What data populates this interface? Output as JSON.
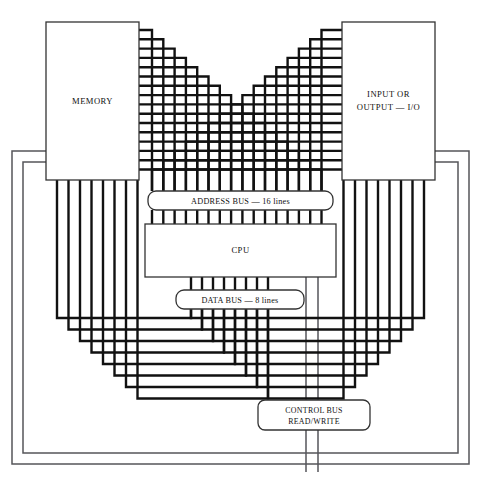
{
  "diagram": {
    "background": "#ffffff",
    "line_color": "#111111",
    "thin_line_color": "#55555a",
    "box_stroke": "#333333",
    "blocks": {
      "memory": {
        "label": "MEMORY",
        "x": 46,
        "y": 22,
        "w": 93,
        "h": 158
      },
      "io": {
        "label_line1": "INPUT OR",
        "label_line2": "OUTPUT — I/O",
        "x": 342,
        "y": 22,
        "w": 93,
        "h": 158
      },
      "cpu": {
        "label": "CPU",
        "x": 145,
        "y": 224,
        "w": 191,
        "h": 53
      },
      "address_bus": {
        "label": "ADDRESS BUS — 16 lines",
        "x": 148,
        "y": 191,
        "w": 185,
        "h": 19,
        "lines": 16
      },
      "data_bus": {
        "label": "DATA BUS — 8 lines",
        "x": 176,
        "y": 290,
        "w": 128,
        "h": 19,
        "lines": 8
      },
      "control_bus": {
        "label_line1": "CONTROL BUS",
        "label_line2": "READ/WRITE",
        "x": 258,
        "y": 400,
        "w": 112,
        "h": 30,
        "lines": 2
      }
    },
    "buses": [
      {
        "name": "address-bus",
        "width_lines": 16,
        "label": "ADDRESS BUS — 16 lines",
        "routing": "staircase-top"
      },
      {
        "name": "data-bus",
        "width_lines": 8,
        "label": "DATA BUS — 8 lines",
        "routing": "nested-u-bottom"
      },
      {
        "name": "control-bus",
        "width_lines": 2,
        "label": "CONTROL BUS READ/WRITE",
        "routing": "outer-perimeter"
      }
    ],
    "geometry": {
      "addr_line_count": 16,
      "addr_pitch": 11.3,
      "addr_first_x": 152,
      "addr_vert_top": 175,
      "data_line_count": 8,
      "data_pitch": 11.0,
      "data_first_x": 191,
      "mem_bottom": 180,
      "io_bottom": 180,
      "data_left_first_x": 57,
      "data_left_pitch": 11.5,
      "data_right_first_x": 424,
      "ctrl_outer_x": 12,
      "ctrl_inner_x": 23,
      "ctrl_outer_right_x": 469,
      "ctrl_inner_right_x": 458,
      "ctrl_top_y": 151,
      "ctrl_top_y2": 162,
      "ctrl_bottom_y": 464,
      "ctrl_bottom_y2": 453,
      "ctrl_stem_x1": 306,
      "ctrl_stem_x2": 318
    }
  }
}
